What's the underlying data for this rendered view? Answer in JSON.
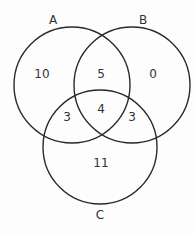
{
  "diagram": {
    "type": "venn-3",
    "sets": [
      {
        "name": "A",
        "cx": 72,
        "cy": 85,
        "r": 58,
        "label_x": 53,
        "label_y": 24
      },
      {
        "name": "B",
        "cx": 132,
        "cy": 85,
        "r": 58,
        "label_x": 143,
        "label_y": 24
      },
      {
        "name": "C",
        "cx": 100,
        "cy": 147,
        "r": 57,
        "label_x": 100,
        "label_y": 219
      }
    ],
    "regions": [
      {
        "id": "A_only",
        "value": "10",
        "x": 42,
        "y": 78
      },
      {
        "id": "A_and_B_only",
        "value": "5",
        "x": 101,
        "y": 78
      },
      {
        "id": "B_only",
        "value": "0",
        "x": 153,
        "y": 78
      },
      {
        "id": "A_and_B_and_C",
        "value": "4",
        "x": 101,
        "y": 113
      },
      {
        "id": "A_and_C_only",
        "value": "3",
        "x": 67,
        "y": 121
      },
      {
        "id": "B_and_C_only",
        "value": "3",
        "x": 132,
        "y": 121
      },
      {
        "id": "C_only",
        "value": "11",
        "x": 101,
        "y": 167
      }
    ],
    "stroke_color": "#2a2a2a",
    "background": "#fdfdfd"
  }
}
